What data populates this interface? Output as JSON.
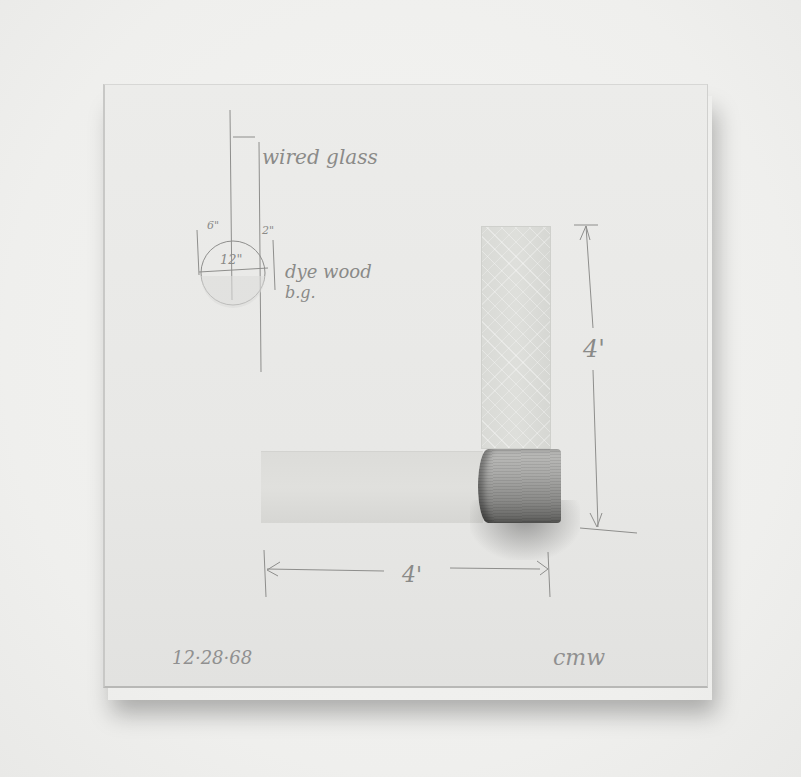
{
  "artwork": {
    "medium_description": "Mounted board with pencil sketch, wired glass pieces and a dyed wood cylinder",
    "annotations": {
      "wired_glass_label": "wired glass",
      "dim_6": "6\"",
      "dim_2": "2\"",
      "dim_12": "12\"",
      "dyed_wood_line1": "dye wood",
      "dyed_wood_line2": "b.g.",
      "vertical_dim": "4'",
      "horizontal_dim": "4'",
      "date": "12·28·68",
      "signature": "cmw"
    },
    "colors": {
      "wall": "#f0f0ee",
      "board": "#e8e8e6",
      "glass": "#dcdcd9",
      "pencil": "#8a8a88",
      "wood": "#9a9a98"
    }
  }
}
